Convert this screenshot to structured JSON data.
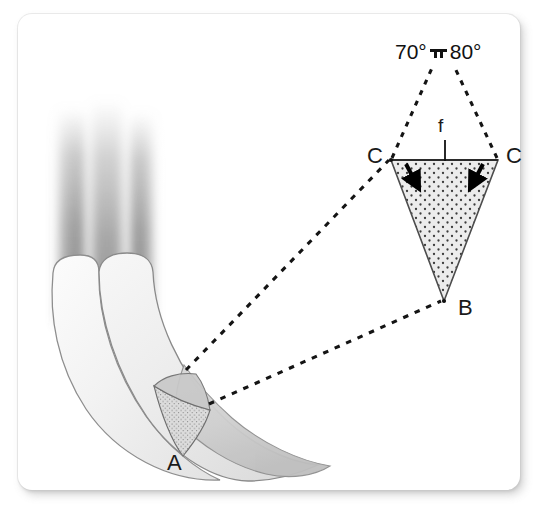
{
  "figure": {
    "type": "anatomical-diagram",
    "background_color": "#ffffff",
    "card_color": "#ffffff",
    "ink_color": "#1a1a1a"
  },
  "angles": {
    "left_value": "70°",
    "right_value": "80°",
    "separator_icon": "bracket-bar-icon"
  },
  "labels": {
    "point_a": "A",
    "point_b": "B",
    "point_c_left": "C",
    "point_c_right": "C",
    "force_f": "f"
  },
  "inset": {
    "name": "magnified-wedge",
    "shape": "inverted-triangle",
    "fill": "stippled",
    "fill_color": "#e9e9e9",
    "stipple_color": "#3a3a3a",
    "stroke_color": "#4a4a4a",
    "apex_label": "B",
    "top_left_label": "C",
    "top_right_label": "C",
    "arrow_count": 2,
    "arrow_color": "#000000"
  },
  "specimen": {
    "name": "curved-root-structure",
    "lobes": 2,
    "blurred_bands": 3,
    "band_color": "#8c8c8c",
    "body_fill": "#f4f4f4",
    "body_stroke": "#8a8a8a",
    "wedge_label": "A",
    "wedge_fill": "#d8d8d8"
  },
  "leader_lines": {
    "style": "dashed",
    "color": "#111111",
    "count": 4
  }
}
